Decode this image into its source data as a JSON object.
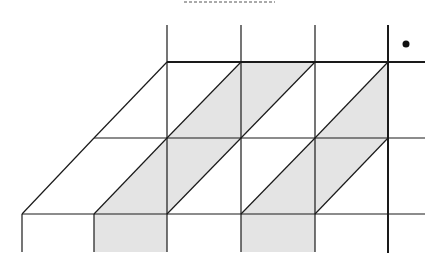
{
  "diagram": {
    "colors": {
      "background": "#ffffff",
      "line": "#1a1a1a",
      "shade": "#e4e4e4",
      "dash": "#555555"
    },
    "dashed_header": {
      "x1": 184,
      "x2": 275,
      "y": 2
    },
    "dot": {
      "cx": 406,
      "cy": 44,
      "r": 3.5
    },
    "grid": {
      "columns_x": [
        22,
        94,
        167,
        241,
        315,
        388
      ],
      "rows_y": [
        62,
        138,
        214
      ],
      "top_stub_y": 25,
      "bottom_stub_y": 252,
      "right_edge_x": 425
    },
    "shaded_regions": [
      {
        "id": "top-parallelogram",
        "points": "167,138 241,62 315,62 241,138"
      },
      {
        "id": "top-triangle",
        "points": "315,138 388,62 388,138"
      },
      {
        "id": "middle-parallelogram-left",
        "points": "94,214 167,138 241,138 167,214"
      },
      {
        "id": "middle-parallelogram-right",
        "points": "241,214 315,138 388,138 315,214"
      },
      {
        "id": "bottom-rect-left",
        "points": "94,214 167,214 167,252 94,252"
      },
      {
        "id": "bottom-rect-right",
        "points": "241,214 315,214 315,252 241,252"
      }
    ]
  }
}
